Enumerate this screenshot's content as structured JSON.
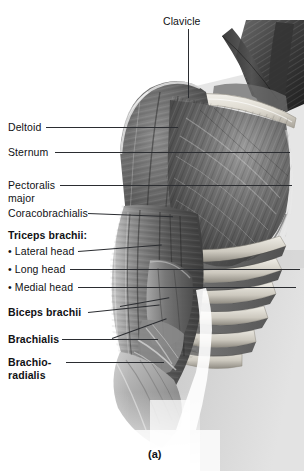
{
  "figure": {
    "caption": "(a)",
    "title_rule": true
  },
  "labels": [
    {
      "id": "clavicle",
      "text": "Clavicle",
      "bold": false
    },
    {
      "id": "deltoid",
      "text": "Deltoid",
      "bold": false
    },
    {
      "id": "sternum",
      "text": "Sternum",
      "bold": false
    },
    {
      "id": "pectoralis",
      "text": "Pectoralis",
      "bold": false
    },
    {
      "id": "pectoralis2",
      "text": "major",
      "bold": false
    },
    {
      "id": "coracobrachialis",
      "text": "Coracobrachialis",
      "bold": false
    },
    {
      "id": "triceps",
      "text": "Triceps brachii:",
      "bold": true
    },
    {
      "id": "lateral-head",
      "text": "• Lateral head",
      "bold": false
    },
    {
      "id": "long-head",
      "text": "• Long head",
      "bold": false
    },
    {
      "id": "medial-head",
      "text": "• Medial head",
      "bold": false
    },
    {
      "id": "biceps",
      "text": "Biceps brachii",
      "bold": true
    },
    {
      "id": "brachialis",
      "text": "Brachialis",
      "bold": true
    },
    {
      "id": "brachio",
      "text": "Brachio-",
      "bold": true
    },
    {
      "id": "radialis",
      "text": "radialis",
      "bold": true
    }
  ],
  "colors": {
    "rule": "#15161a",
    "text": "#101114",
    "leader": "#2b2d31",
    "background": "#ffffff",
    "skin_light": "#d9d9d9",
    "muscle_mid": "#8b8b8b",
    "muscle_dark": "#4a4a4a",
    "muscle_darkest": "#2e2e2e",
    "bone_light": "#e8e6e0"
  }
}
